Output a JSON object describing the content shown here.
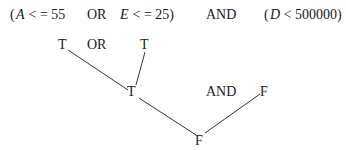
{
  "expression": {
    "open1": "(",
    "var_a": "A",
    "cond_a": " < = 55",
    "op1": "OR",
    "var_e": "E",
    "cond_e": " < = 25)",
    "op2": "AND",
    "open2": "(",
    "var_d": "D",
    "cond_d": " < 500000)"
  },
  "tree": {
    "leaf_a": "T",
    "leaf_or": "OR",
    "leaf_e": "T",
    "or_result": "T",
    "and_label": "AND",
    "leaf_d": "F",
    "final_result": "F"
  },
  "colors": {
    "ink": "#1a1a1a",
    "line": "#333333",
    "background": "#ffffff"
  }
}
